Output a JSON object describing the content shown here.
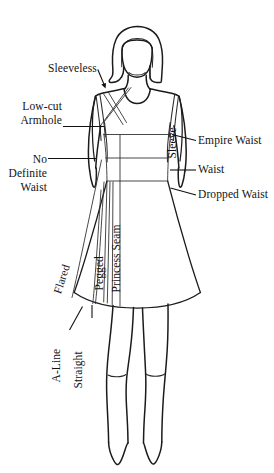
{
  "diagram": {
    "background_color": "#ffffff",
    "ink_color": "#1b1b1b",
    "labels": {
      "sleeveless": "Sleeveless",
      "low_cut": "Low-cut",
      "armhole": "Armhole",
      "sleeve": "Sleeve",
      "empire_waist": "Empire Waist",
      "waist": "Waist",
      "dropped_waist": "Dropped Waist",
      "no": "No",
      "definite": "Definite",
      "waist_2": "Waist",
      "princess_seam": "Princess Seam",
      "pegged": "Pegged",
      "flared": "Flared",
      "a_line": "A-Line",
      "straight": "Straight"
    },
    "label_groups": {
      "upper_left": [
        "Sleeveless",
        "Low-cut",
        "Armhole"
      ],
      "lower_left": [
        "No",
        "Definite",
        "Waist"
      ],
      "right": [
        "Sleeve",
        "Empire Waist",
        "Waist",
        "Dropped Waist"
      ],
      "skirt_vertical": [
        "Princess Seam",
        "Pegged",
        "Flared"
      ],
      "hem_vertical": [
        "A-Line",
        "Straight"
      ]
    }
  }
}
